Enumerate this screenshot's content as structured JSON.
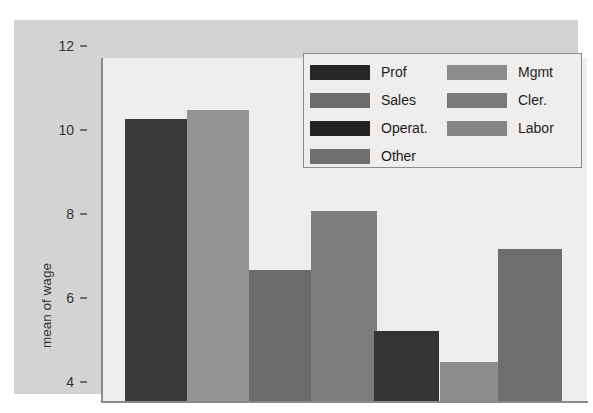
{
  "chart_data": {
    "type": "bar",
    "title": "",
    "xlabel": "",
    "ylabel": "mean of wage",
    "ylim": [
      4,
      12
    ],
    "yticks": [
      12,
      10,
      8,
      6,
      4
    ],
    "ytick_labels": [
      "12",
      "10",
      "8",
      "6",
      "4"
    ],
    "grid": false,
    "legend_position": "top-right",
    "categories": [
      "Prof",
      "Mgmt",
      "Sales",
      "Cler.",
      "Operat.",
      "Other",
      "Labor"
    ],
    "values": [
      10.75,
      10.95,
      7.15,
      8.55,
      5.7,
      4.95,
      7.65
    ],
    "bar_colors": [
      "#3a3a3a",
      "#949494",
      "#6b6b6b",
      "#7d7d7d",
      "#343434",
      "#8d8d8d",
      "#6e6e6e"
    ],
    "series": [
      {
        "name": "mean of wage",
        "points": [
          {
            "category": "Prof",
            "value": 10.75,
            "color": "#3a3a3a"
          },
          {
            "category": "Mgmt",
            "value": 10.95,
            "color": "#949494"
          },
          {
            "category": "Sales",
            "value": 7.15,
            "color": "#6b6b6b"
          },
          {
            "category": "Cler.",
            "value": 8.55,
            "color": "#7d7d7d"
          },
          {
            "category": "Operat.",
            "value": 5.7,
            "color": "#343434"
          },
          {
            "category": "Other",
            "value": 4.95,
            "color": "#8d8d8d"
          },
          {
            "category": "Labor",
            "value": 7.65,
            "color": "#6e6e6e"
          }
        ]
      }
    ]
  },
  "legend": {
    "left_column": [
      {
        "label": "Prof",
        "color": "#262626"
      },
      {
        "label": "Sales",
        "color": "#6b6b6b"
      },
      {
        "label": "Operat.",
        "color": "#222222"
      },
      {
        "label": "Other",
        "color": "#6f6f6f"
      }
    ],
    "right_column": [
      {
        "label": "Mgmt",
        "color": "#8c8c8c"
      },
      {
        "label": "Cler.",
        "color": "#7a7a7a"
      },
      {
        "label": "Labor",
        "color": "#868686"
      }
    ]
  },
  "figure": {
    "canvas_color": "#d3d3d3",
    "plot_background": "#efeeec",
    "axis_color": "#8a8a8a"
  }
}
